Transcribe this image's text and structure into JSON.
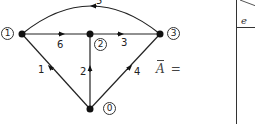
{
  "graph": {
    "nodes": [
      {
        "id": "0",
        "label": "0"
      },
      {
        "id": "1",
        "label": "1"
      },
      {
        "id": "2",
        "label": "2"
      },
      {
        "id": "3",
        "label": "3"
      }
    ],
    "edges": [
      {
        "label": "1",
        "from": "0",
        "to": "1"
      },
      {
        "label": "2",
        "from": "0",
        "to": "2"
      },
      {
        "label": "3",
        "from": "2",
        "to": "3"
      },
      {
        "label": "4",
        "from": "0",
        "to": "3"
      },
      {
        "label": "5",
        "from": "3",
        "to": "1"
      },
      {
        "label": "6",
        "from": "1",
        "to": "2"
      }
    ]
  },
  "matrix": {
    "symbol": "A",
    "equals": "=",
    "column_header": "e"
  }
}
